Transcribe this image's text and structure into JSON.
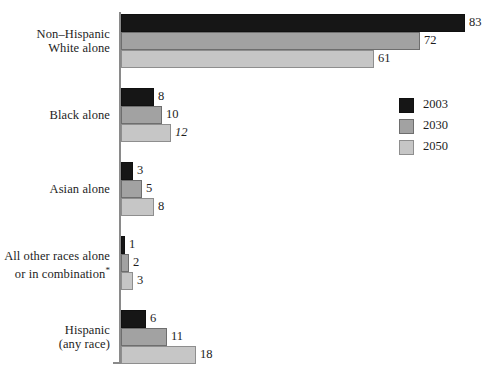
{
  "chart_data": {
    "type": "bar",
    "orientation": "horizontal",
    "title": "",
    "xlabel": "",
    "ylabel": "",
    "grid": false,
    "legend_position": "right",
    "xlim": [
      0,
      83
    ],
    "categories": [
      "Non–Hispanic\nWhite alone",
      "Black alone",
      "Asian alone",
      "All other races alone\nor in combination*",
      "Hispanic\n(any race)"
    ],
    "series": [
      {
        "name": "2003",
        "color": "#161616",
        "values": [
          83,
          8,
          3,
          1,
          6
        ]
      },
      {
        "name": "2030",
        "color": "#a2a2a2",
        "values": [
          72,
          10,
          5,
          2,
          11
        ]
      },
      {
        "name": "2050",
        "color": "#c6c6c6",
        "values": [
          61,
          12,
          8,
          3,
          18
        ]
      }
    ]
  },
  "groups": [
    {
      "label_line1": "Non–Hispanic",
      "label_line2": "White alone",
      "bars": [
        {
          "year": "2003",
          "value": 83,
          "value_text": "83",
          "italic": false
        },
        {
          "year": "2030",
          "value": 72,
          "value_text": "72",
          "italic": false
        },
        {
          "year": "2050",
          "value": 61,
          "value_text": "61",
          "italic": false
        }
      ]
    },
    {
      "label_line1": "Black alone",
      "label_line2": "",
      "bars": [
        {
          "year": "2003",
          "value": 8,
          "value_text": "8",
          "italic": false
        },
        {
          "year": "2030",
          "value": 10,
          "value_text": "10",
          "italic": false
        },
        {
          "year": "2050",
          "value": 12,
          "value_text": "12",
          "italic": true
        }
      ]
    },
    {
      "label_line1": "Asian alone",
      "label_line2": "",
      "bars": [
        {
          "year": "2003",
          "value": 3,
          "value_text": "3",
          "italic": false
        },
        {
          "year": "2030",
          "value": 5,
          "value_text": "5",
          "italic": false
        },
        {
          "year": "2050",
          "value": 8,
          "value_text": "8",
          "italic": false
        }
      ]
    },
    {
      "label_line1": "All other races alone",
      "label_line2": "or in combination*",
      "bars": [
        {
          "year": "2003",
          "value": 1,
          "value_text": "1",
          "italic": false
        },
        {
          "year": "2030",
          "value": 2,
          "value_text": "2",
          "italic": false
        },
        {
          "year": "2050",
          "value": 3,
          "value_text": "3",
          "italic": false
        }
      ]
    },
    {
      "label_line1": "Hispanic",
      "label_line2": "(any race)",
      "bars": [
        {
          "year": "2003",
          "value": 6,
          "value_text": "6",
          "italic": false
        },
        {
          "year": "2030",
          "value": 11,
          "value_text": "11",
          "italic": false
        },
        {
          "year": "2050",
          "value": 18,
          "value_text": "18",
          "italic": false
        }
      ]
    }
  ],
  "legend": {
    "items": [
      {
        "label": "2003",
        "color": "#161616",
        "swatch_class": "y2003"
      },
      {
        "label": "2030",
        "color": "#a2a2a2",
        "swatch_class": "y2030"
      },
      {
        "label": "2050",
        "color": "#c6c6c6",
        "swatch_class": "y2050"
      }
    ]
  },
  "layout": {
    "plot_left_px": 121,
    "px_per_unit": 4.148,
    "bar_height_px": 18,
    "group_tops_px": [
      14,
      88,
      162,
      236,
      310
    ]
  }
}
